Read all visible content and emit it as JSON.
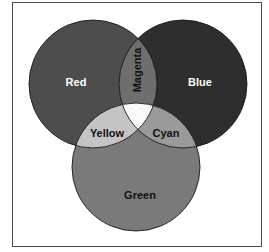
{
  "diagram": {
    "type": "venn",
    "sets": [
      {
        "id": "red",
        "label": "Red",
        "fill": "#4d4d4d",
        "cx": 93,
        "cy": 84,
        "r": 64,
        "label_x": 76,
        "label_y": 86,
        "label_color": "#ffffff"
      },
      {
        "id": "blue",
        "label": "Blue",
        "fill": "#2e2e2e",
        "cx": 183,
        "cy": 84,
        "r": 64,
        "label_x": 200,
        "label_y": 86,
        "label_color": "#ffffff"
      },
      {
        "id": "green",
        "label": "Green",
        "fill": "#7a7a7a",
        "cx": 136,
        "cy": 167,
        "r": 64,
        "label_x": 140,
        "label_y": 199,
        "label_color": "#111111"
      }
    ],
    "intersections": [
      {
        "id": "magenta",
        "sets": [
          "red",
          "blue"
        ],
        "label": "Magenta",
        "fill": "#6e6e6e",
        "label_color": "#111111",
        "rotated": true
      },
      {
        "id": "yellow",
        "sets": [
          "red",
          "green"
        ],
        "label": "Yellow",
        "fill": "#c4c4c4",
        "label_color": "#111111"
      },
      {
        "id": "cyan",
        "sets": [
          "blue",
          "green"
        ],
        "label": "Cyan",
        "fill": "#9a9a9a",
        "label_color": "#111111"
      },
      {
        "id": "white",
        "sets": [
          "red",
          "blue",
          "green"
        ],
        "label": "",
        "fill": "#fafafa"
      }
    ]
  },
  "labels": {
    "red": "Red",
    "blue": "Blue",
    "green": "Green",
    "magenta": "Magenta",
    "yellow": "Yellow",
    "cyan": "Cyan"
  }
}
